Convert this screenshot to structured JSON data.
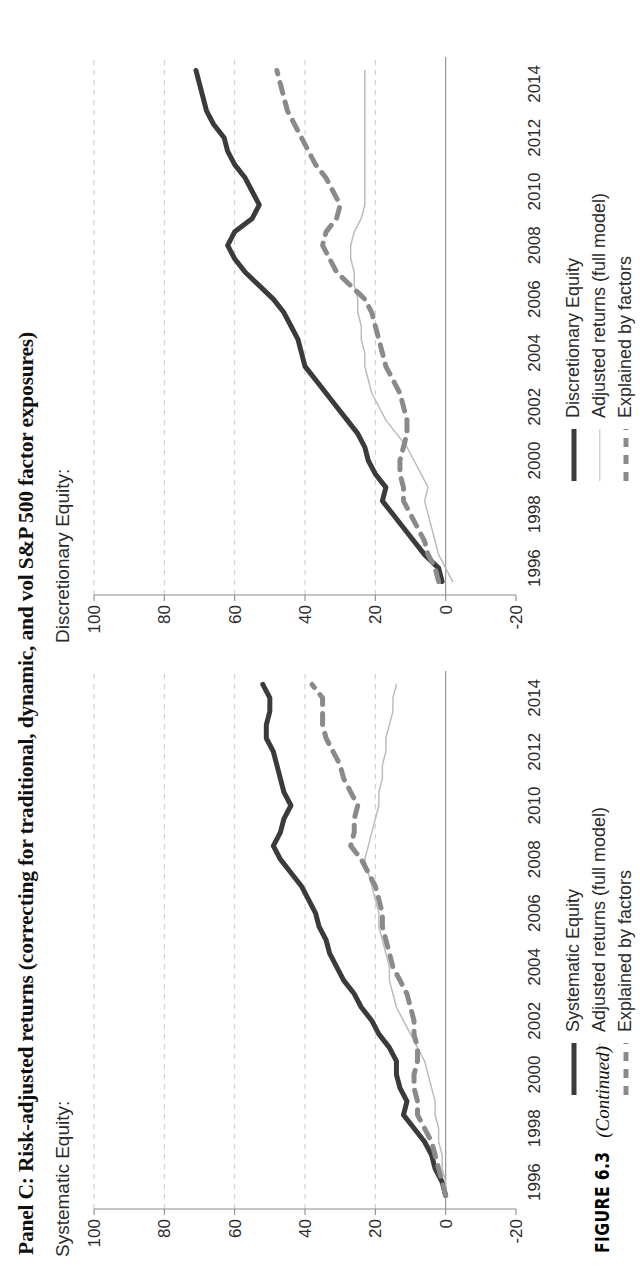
{
  "panel": {
    "title": "Panel C: Risk-adjusted returns (correcting for traditional, dynamic, and vol S&P 500 factor exposures)"
  },
  "figure_caption": {
    "label": "FIGURE 6.3",
    "continued": "(Continued)"
  },
  "charts": [
    {
      "id": "systematic",
      "subtitle": "Systematic Equity:",
      "legend": [
        {
          "label": "Systematic Equity",
          "key": "solid-thick",
          "color": "#3b3b3b"
        },
        {
          "label": "Adjusted returns (full model)",
          "key": "solid-thin",
          "color": "#bdbdbd"
        },
        {
          "label": "Explained by factors",
          "key": "dashed",
          "color": "#8a8a8a"
        }
      ]
    },
    {
      "id": "discretionary",
      "subtitle": "Discretionary Equity:",
      "legend": [
        {
          "label": "Discretionary Equity",
          "key": "solid-thick",
          "color": "#3b3b3b"
        },
        {
          "label": "Adjusted returns (full model)",
          "key": "solid-thin",
          "color": "#bdbdbd"
        },
        {
          "label": "Explained by factors",
          "key": "dashed",
          "color": "#8a8a8a"
        }
      ]
    }
  ],
  "chart_data": [
    {
      "type": "line",
      "id": "systematic",
      "title": "Systematic Equity:",
      "xlabel": "",
      "ylabel": "",
      "xlim": [
        1995.0,
        2015.0
      ],
      "ylim": [
        -20,
        100
      ],
      "xticks": [
        1996,
        1998,
        2000,
        2002,
        2004,
        2006,
        2008,
        2010,
        2012,
        2014
      ],
      "yticks": [
        -20,
        0,
        20,
        40,
        60,
        80,
        100
      ],
      "grid": "horizontal-dashed",
      "legend_position": "below-left",
      "series": [
        {
          "name": "Systematic Equity",
          "style": "solid-thick",
          "color": "#3b3b3b",
          "x": [
            1995.5,
            1996.0,
            1996.5,
            1997.0,
            1997.5,
            1998.0,
            1998.5,
            1999.0,
            1999.5,
            2000.0,
            2000.5,
            2001.0,
            2001.5,
            2002.0,
            2002.5,
            2003.0,
            2003.5,
            2004.0,
            2004.5,
            2005.0,
            2005.5,
            2006.0,
            2006.5,
            2007.0,
            2007.5,
            2008.0,
            2008.5,
            2009.0,
            2009.5,
            2010.0,
            2010.5,
            2011.0,
            2011.5,
            2012.0,
            2012.5,
            2013.0,
            2013.5,
            2014.0,
            2014.5
          ],
          "y": [
            0,
            1,
            3,
            4,
            6,
            9,
            12,
            11,
            13,
            14,
            14,
            16,
            19,
            21,
            24,
            26,
            29,
            31,
            33,
            34,
            36,
            37,
            39,
            41,
            44,
            47,
            49,
            47,
            46,
            44,
            46,
            47,
            48,
            49,
            51,
            51,
            50,
            50,
            52
          ]
        },
        {
          "name": "Adjusted returns (full model)",
          "style": "solid-thin",
          "color": "#bdbdbd",
          "x": [
            1995.5,
            1996.0,
            1996.5,
            1997.0,
            1997.5,
            1998.0,
            1998.5,
            1999.0,
            1999.5,
            2000.0,
            2000.5,
            2001.0,
            2001.5,
            2002.0,
            2002.5,
            2003.0,
            2003.5,
            2004.0,
            2004.5,
            2005.0,
            2005.5,
            2006.0,
            2006.5,
            2007.0,
            2007.5,
            2008.0,
            2008.5,
            2009.0,
            2009.5,
            2010.0,
            2010.5,
            2011.0,
            2011.5,
            2012.0,
            2012.5,
            2013.0,
            2013.5,
            2014.0,
            2014.5
          ],
          "y": [
            0,
            0,
            1,
            1,
            2,
            2,
            3,
            3,
            4,
            5,
            6,
            8,
            10,
            12,
            14,
            15,
            16,
            16,
            17,
            18,
            19,
            19,
            20,
            21,
            22,
            23,
            22,
            21,
            20,
            19,
            19,
            18,
            18,
            17,
            17,
            16,
            15,
            15,
            14
          ]
        },
        {
          "name": "Explained by factors",
          "style": "dashed",
          "color": "#8a8a8a",
          "x": [
            1995.5,
            1996.0,
            1996.5,
            1997.0,
            1997.5,
            1998.0,
            1998.5,
            1999.0,
            1999.5,
            2000.0,
            2000.5,
            2001.0,
            2001.5,
            2002.0,
            2002.5,
            2003.0,
            2003.5,
            2004.0,
            2004.5,
            2005.0,
            2005.5,
            2006.0,
            2006.5,
            2007.0,
            2007.5,
            2008.0,
            2008.5,
            2009.0,
            2009.5,
            2010.0,
            2010.5,
            2011.0,
            2011.5,
            2012.0,
            2012.5,
            2013.0,
            2013.5,
            2014.0,
            2014.5
          ],
          "y": [
            0,
            1,
            2,
            3,
            4,
            6,
            8,
            8,
            9,
            9,
            8,
            8,
            9,
            9,
            10,
            11,
            13,
            15,
            16,
            17,
            18,
            18,
            19,
            20,
            22,
            24,
            27,
            26,
            26,
            25,
            27,
            29,
            30,
            32,
            34,
            35,
            35,
            35,
            38
          ]
        }
      ]
    },
    {
      "type": "line",
      "id": "discretionary",
      "title": "Discretionary Equity:",
      "xlabel": "",
      "ylabel": "",
      "xlim": [
        1995.0,
        2015.0
      ],
      "ylim": [
        -20,
        100
      ],
      "xticks": [
        1996,
        1998,
        2000,
        2002,
        2004,
        2006,
        2008,
        2010,
        2012,
        2014
      ],
      "yticks": [
        -20,
        0,
        20,
        40,
        60,
        80,
        100
      ],
      "grid": "horizontal-dashed",
      "legend_position": "below-left",
      "series": [
        {
          "name": "Discretionary Equity",
          "style": "solid-thick",
          "color": "#3b3b3b",
          "x": [
            1995.5,
            1996.0,
            1996.5,
            1997.0,
            1997.5,
            1998.0,
            1998.5,
            1999.0,
            1999.5,
            2000.0,
            2000.5,
            2001.0,
            2001.5,
            2002.0,
            2002.5,
            2003.0,
            2003.5,
            2004.0,
            2004.5,
            2005.0,
            2005.5,
            2006.0,
            2006.5,
            2007.0,
            2007.5,
            2008.0,
            2008.5,
            2009.0,
            2009.5,
            2010.0,
            2010.5,
            2011.0,
            2011.5,
            2012.0,
            2012.5,
            2013.0,
            2013.5,
            2014.0,
            2014.5
          ],
          "y": [
            1,
            2,
            6,
            9,
            12,
            15,
            18,
            17,
            20,
            22,
            23,
            25,
            28,
            31,
            34,
            37,
            40,
            41,
            42,
            44,
            46,
            49,
            53,
            57,
            60,
            62,
            60,
            55,
            53,
            55,
            57,
            60,
            62,
            63,
            66,
            68,
            69,
            70,
            71
          ]
        },
        {
          "name": "Adjusted returns (full model)",
          "style": "solid-thin",
          "color": "#bdbdbd",
          "x": [
            1995.5,
            1996.0,
            1996.5,
            1997.0,
            1997.5,
            1998.0,
            1998.5,
            1999.0,
            1999.5,
            2000.0,
            2000.5,
            2001.0,
            2001.5,
            2002.0,
            2002.5,
            2003.0,
            2003.5,
            2004.0,
            2004.5,
            2005.0,
            2005.5,
            2006.0,
            2006.5,
            2007.0,
            2007.5,
            2008.0,
            2008.5,
            2009.0,
            2009.5,
            2010.0,
            2010.5,
            2011.0,
            2011.5,
            2012.0,
            2012.5,
            2013.0,
            2013.5,
            2014.0,
            2014.5
          ],
          "y": [
            -2,
            0,
            2,
            3,
            4,
            5,
            6,
            5,
            7,
            9,
            11,
            14,
            17,
            19,
            21,
            22,
            23,
            23,
            24,
            24,
            25,
            25,
            26,
            26,
            27,
            27,
            26,
            24,
            23,
            23,
            23,
            23,
            23,
            23,
            23,
            23,
            23,
            23,
            23
          ]
        },
        {
          "name": "Explained by factors",
          "style": "dashed",
          "color": "#8a8a8a",
          "x": [
            1995.5,
            1996.0,
            1996.5,
            1997.0,
            1997.5,
            1998.0,
            1998.5,
            1999.0,
            1999.5,
            2000.0,
            2000.5,
            2001.0,
            2001.5,
            2002.0,
            2002.5,
            2003.0,
            2003.5,
            2004.0,
            2004.5,
            2005.0,
            2005.5,
            2006.0,
            2006.5,
            2007.0,
            2007.5,
            2008.0,
            2008.5,
            2009.0,
            2009.5,
            2010.0,
            2010.5,
            2011.0,
            2011.5,
            2012.0,
            2012.5,
            2013.0,
            2013.5,
            2014.0,
            2014.5
          ],
          "y": [
            2,
            3,
            5,
            6,
            8,
            10,
            12,
            12,
            13,
            13,
            12,
            11,
            11,
            12,
            13,
            15,
            17,
            18,
            19,
            20,
            21,
            23,
            27,
            31,
            33,
            35,
            34,
            31,
            30,
            32,
            34,
            37,
            39,
            41,
            43,
            45,
            46,
            47,
            48
          ]
        }
      ]
    }
  ]
}
